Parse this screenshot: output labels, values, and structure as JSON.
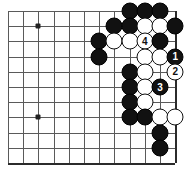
{
  "board": {
    "title": "Go board diagram",
    "grid": {
      "origin_x": 8,
      "origin_y": 11,
      "spacing": 15.2,
      "cols": 12,
      "rows": 11,
      "right_edge_col": 11,
      "bottom_edge_row": 10,
      "line_color": "#5a5a5a",
      "edge_color": "#2b2b2b"
    },
    "hoshi": [
      {
        "col": 2,
        "row": 1
      },
      {
        "col": 2,
        "row": 7
      }
    ],
    "stones": [
      {
        "col": 8,
        "row": 0,
        "color": "black",
        "label": ""
      },
      {
        "col": 9,
        "row": 0,
        "color": "black",
        "label": ""
      },
      {
        "col": 10,
        "row": 0,
        "color": "black",
        "label": ""
      },
      {
        "col": 7,
        "row": 1,
        "color": "black",
        "label": ""
      },
      {
        "col": 8,
        "row": 1,
        "color": "black",
        "label": ""
      },
      {
        "col": 9,
        "row": 1,
        "color": "white",
        "label": ""
      },
      {
        "col": 10,
        "row": 1,
        "color": "white",
        "label": ""
      },
      {
        "col": 11,
        "row": 1,
        "color": "black",
        "label": ""
      },
      {
        "col": 6,
        "row": 2,
        "color": "black",
        "label": ""
      },
      {
        "col": 7,
        "row": 2,
        "color": "white",
        "label": ""
      },
      {
        "col": 8,
        "row": 2,
        "color": "white",
        "label": ""
      },
      {
        "col": 9,
        "row": 2,
        "color": "white",
        "label": "4"
      },
      {
        "col": 10,
        "row": 2,
        "color": "black",
        "label": ""
      },
      {
        "col": 6,
        "row": 3,
        "color": "black",
        "label": ""
      },
      {
        "col": 9,
        "row": 3,
        "color": "white",
        "label": ""
      },
      {
        "col": 10,
        "row": 3,
        "color": "white",
        "label": ""
      },
      {
        "col": 11,
        "row": 3,
        "color": "black",
        "label": "1"
      },
      {
        "col": 8,
        "row": 4,
        "color": "black",
        "label": ""
      },
      {
        "col": 9,
        "row": 4,
        "color": "white",
        "label": ""
      },
      {
        "col": 11,
        "row": 4,
        "color": "white",
        "label": "2"
      },
      {
        "col": 8,
        "row": 5,
        "color": "black",
        "label": ""
      },
      {
        "col": 9,
        "row": 5,
        "color": "white",
        "label": ""
      },
      {
        "col": 10,
        "row": 5,
        "color": "black",
        "label": "3"
      },
      {
        "col": 8,
        "row": 6,
        "color": "black",
        "label": ""
      },
      {
        "col": 9,
        "row": 6,
        "color": "white",
        "label": ""
      },
      {
        "col": 8,
        "row": 7,
        "color": "black",
        "label": ""
      },
      {
        "col": 9,
        "row": 7,
        "color": "black",
        "label": ""
      },
      {
        "col": 10,
        "row": 7,
        "color": "white",
        "label": ""
      },
      {
        "col": 11,
        "row": 7,
        "color": "white",
        "label": ""
      },
      {
        "col": 10,
        "row": 8,
        "color": "black",
        "label": ""
      },
      {
        "col": 10,
        "row": 9,
        "color": "black",
        "label": ""
      }
    ],
    "move_markers": [
      {
        "number": "1",
        "color": "black",
        "col": 11,
        "row": 3
      },
      {
        "number": "2",
        "color": "white",
        "col": 11,
        "row": 4
      },
      {
        "number": "3",
        "color": "black",
        "col": 10,
        "row": 5
      },
      {
        "number": "4",
        "color": "white",
        "col": 9,
        "row": 2
      }
    ],
    "colors": {
      "black_stone": "#111111",
      "white_stone": "#ffffff",
      "black_label": "#ffffff",
      "white_label": "#111111",
      "background": "#ffffff"
    }
  }
}
